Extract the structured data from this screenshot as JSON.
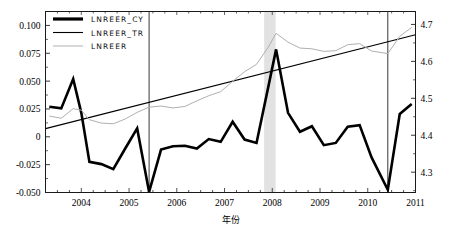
{
  "chart_data": {
    "type": "line",
    "title": "",
    "xlabel": "年份",
    "ylabel": "",
    "xlim": [
      2003.25,
      2011.0
    ],
    "ylim_left": [
      -0.05,
      0.1125
    ],
    "ylim_right": [
      4.245,
      4.735
    ],
    "grid": false,
    "legend_position": "top-left",
    "x_ticks": [
      "2004",
      "2005",
      "2006",
      "2007",
      "2008",
      "2009",
      "2010",
      "2011"
    ],
    "x_tick_values": [
      2004,
      2005,
      2006,
      2007,
      2008,
      2009,
      2010,
      2011
    ],
    "y_ticks_left": [
      "0.100",
      "0.075",
      "0.050",
      "0.025",
      "0",
      "-0.025",
      "-0.050"
    ],
    "y_tick_values_left": [
      0.1,
      0.075,
      0.05,
      0.025,
      0,
      -0.025,
      -0.05
    ],
    "y_ticks_right": [
      "4.7",
      "4.6",
      "4.5",
      "4.4",
      "4.3"
    ],
    "y_tick_values_right": [
      4.7,
      4.6,
      4.5,
      4.4,
      4.3
    ],
    "annotations": {
      "shaded_band": {
        "x_start": 2007.83,
        "x_end": 2008.07,
        "color": "#e2e2e2"
      },
      "vertical_lines": [
        2005.42,
        2010.42
      ]
    },
    "series": [
      {
        "name": "LNREER_CY",
        "axis": "left",
        "color": "#000000",
        "width": 2.6,
        "x": [
          2003.33,
          2003.58,
          2003.83,
          2004.0,
          2004.17,
          2004.42,
          2004.67,
          2004.92,
          2005.17,
          2005.42,
          2005.67,
          2005.92,
          2006.17,
          2006.42,
          2006.67,
          2006.92,
          2007.17,
          2007.42,
          2007.67,
          2007.92,
          2008.08,
          2008.33,
          2008.58,
          2008.83,
          2009.08,
          2009.33,
          2009.58,
          2009.83,
          2010.08,
          2010.42,
          2010.67,
          2010.92
        ],
        "values": [
          0.027,
          0.0255,
          0.052,
          0.0215,
          -0.0225,
          -0.0245,
          -0.029,
          -0.0105,
          0.0075,
          -0.0495,
          -0.0115,
          -0.0085,
          -0.008,
          -0.0105,
          -0.002,
          -0.0045,
          0.0135,
          -0.0025,
          -0.0055,
          0.0455,
          0.0785,
          0.0215,
          0.0045,
          0.0095,
          -0.0075,
          -0.0055,
          0.009,
          0.0105,
          -0.0185,
          -0.0475,
          0.0205,
          0.0295
        ]
      },
      {
        "name": "LNREER_TR",
        "axis": "right",
        "color": "#000000",
        "width": 1.1,
        "x": [
          2003.25,
          2011.0
        ],
        "values": [
          4.418,
          4.672
        ]
      },
      {
        "name": "LNREER",
        "axis": "right",
        "color": "#b0b0b0",
        "width": 1.0,
        "x": [
          2003.33,
          2003.58,
          2003.83,
          2004.0,
          2004.17,
          2004.42,
          2004.67,
          2004.92,
          2005.17,
          2005.42,
          2005.67,
          2005.92,
          2006.17,
          2006.42,
          2006.67,
          2006.92,
          2007.17,
          2007.42,
          2007.67,
          2007.92,
          2008.08,
          2008.33,
          2008.58,
          2008.83,
          2009.08,
          2009.33,
          2009.58,
          2009.83,
          2010.08,
          2010.42,
          2010.67,
          2010.92
        ],
        "values": [
          4.452,
          4.446,
          4.472,
          4.468,
          4.442,
          4.433,
          4.431,
          4.444,
          4.462,
          4.476,
          4.479,
          4.474,
          4.478,
          4.493,
          4.507,
          4.518,
          4.546,
          4.572,
          4.592,
          4.639,
          4.676,
          4.652,
          4.636,
          4.634,
          4.627,
          4.629,
          4.645,
          4.648,
          4.628,
          4.621,
          4.668,
          4.692
        ]
      }
    ],
    "legend": [
      {
        "label": "LNREER_CY",
        "color": "#000000",
        "width": 3.2
      },
      {
        "label": "LNREER_TR",
        "color": "#000000",
        "width": 1.1
      },
      {
        "label": "LNREER",
        "color": "#b0b0b0",
        "width": 1.0
      }
    ]
  }
}
